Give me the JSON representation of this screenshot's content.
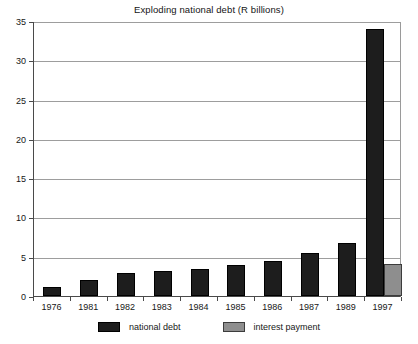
{
  "chart_data": {
    "type": "bar",
    "title": "Exploding national debt (R billions)",
    "xlabel": "",
    "ylabel": "",
    "ylim": [
      0,
      35
    ],
    "yticks": [
      0,
      5,
      10,
      15,
      20,
      25,
      30,
      35
    ],
    "ytick_labels": [
      "0",
      "5",
      "10",
      "15",
      "20",
      "25",
      "30",
      "35"
    ],
    "grid": true,
    "legend_position": "bottom",
    "categories": [
      "1976",
      "1981",
      "1982",
      "1983",
      "1984",
      "1985",
      "1986",
      "1987",
      "1989",
      "1997"
    ],
    "series": [
      {
        "name": "national debt",
        "color": "#1d1d1d",
        "values": [
          1.1,
          2.1,
          2.9,
          3.2,
          3.5,
          4.0,
          4.5,
          5.5,
          6.7,
          34.0
        ]
      },
      {
        "name": "interest payment",
        "color": "#8e8e8e",
        "values": [
          null,
          null,
          null,
          null,
          null,
          null,
          null,
          null,
          null,
          4.1
        ]
      }
    ]
  },
  "legend": {
    "items": [
      {
        "label": "national debt",
        "swatch": "debt"
      },
      {
        "label": "interest payment",
        "swatch": "interest"
      }
    ]
  }
}
